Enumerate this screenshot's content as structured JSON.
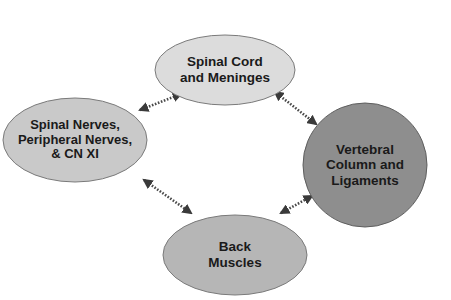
{
  "diagram": {
    "nodes": [
      {
        "id": "spinal-cord",
        "lines": [
          "Spinal Cord",
          "and Meninges"
        ],
        "shape": "ellipse",
        "fill": "#dcdcdc",
        "stroke": "#7a7a7a"
      },
      {
        "id": "spinal-nerves",
        "lines": [
          "Spinal Nerves,",
          "Peripheral Nerves,",
          "& CN XI"
        ],
        "shape": "ellipse",
        "fill": "#c9c9c9",
        "stroke": "#7a7a7a"
      },
      {
        "id": "vertebral-column",
        "lines": [
          "Vertebral",
          "Column and",
          "Ligaments"
        ],
        "shape": "circle",
        "fill": "#8e8e8e",
        "stroke": "#5e5e5e"
      },
      {
        "id": "back-muscles",
        "lines": [
          "Back",
          "Muscles"
        ],
        "shape": "ellipse",
        "fill": "#b6b6b6",
        "stroke": "#7a7a7a"
      }
    ],
    "edges": [
      {
        "from": "spinal-cord",
        "to": "spinal-nerves",
        "style": "dotted",
        "arrows": "both"
      },
      {
        "from": "spinal-cord",
        "to": "vertebral-column",
        "style": "dotted",
        "arrows": "both"
      },
      {
        "from": "spinal-nerves",
        "to": "back-muscles",
        "style": "dotted",
        "arrows": "both"
      },
      {
        "from": "back-muscles",
        "to": "vertebral-column",
        "style": "dotted",
        "arrows": "both"
      }
    ],
    "colors": {
      "arrow": "#4a4a4a",
      "text": "#1a1a1a"
    }
  }
}
